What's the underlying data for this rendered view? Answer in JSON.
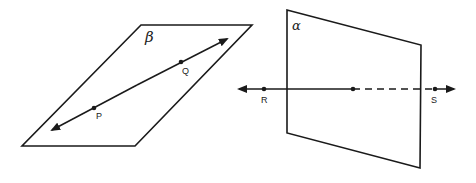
{
  "diagram": {
    "planes": [
      {
        "id": "beta",
        "label": "β",
        "corners": [
          [
            141,
            25
          ],
          [
            252,
            25
          ],
          [
            135,
            146
          ],
          [
            22,
            146
          ]
        ],
        "label_pos": [
          145,
          41
        ],
        "line": {
          "description": "Line PQ lying in plane β",
          "start_arrow": [
            50,
            131
          ],
          "end_arrow": [
            229,
            38
          ],
          "points": [
            {
              "name": "P",
              "x": 94,
              "y": 108,
              "label_x": 97,
              "label_y": 118
            },
            {
              "name": "Q",
              "x": 181,
              "y": 62,
              "label_x": 183,
              "label_y": 73
            }
          ]
        }
      },
      {
        "id": "alpha",
        "label": "α",
        "corners": [
          [
            287,
            10
          ],
          [
            421,
            45
          ],
          [
            420,
            168
          ],
          [
            287,
            133
          ]
        ],
        "label_pos": [
          292,
          30
        ],
        "line": {
          "description": "Line RS intersecting plane α at one point",
          "start_arrow": [
            237,
            89
          ],
          "end_arrow": [
            456,
            89
          ],
          "intersection": {
            "x": 353,
            "y": 89
          },
          "dashed_from": 353,
          "dashed_to": 440,
          "points": [
            {
              "name": "R",
              "x": 264,
              "y": 89,
              "label_x": 261,
              "label_y": 103
            },
            {
              "name": "S",
              "x": 435,
              "y": 89,
              "label_x": 431,
              "label_y": 103
            }
          ]
        }
      }
    ],
    "stroke_color": "#1a1a1a"
  }
}
